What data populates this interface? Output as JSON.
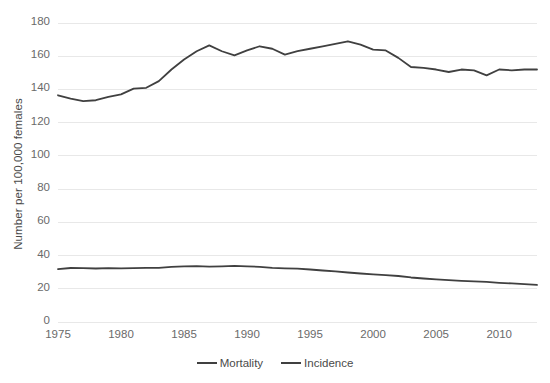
{
  "chart_data": {
    "type": "line",
    "title": "",
    "xlabel": "",
    "ylabel": "Number per 100,000 females",
    "xlim": [
      1975,
      2013
    ],
    "ylim": [
      0,
      180
    ],
    "ytick_labels": [
      "180",
      "160",
      "140",
      "120",
      "100",
      "80",
      "60",
      "40",
      "20",
      "0"
    ],
    "ytick_values": [
      180,
      160,
      140,
      120,
      100,
      80,
      60,
      40,
      20,
      0
    ],
    "xtick_labels": [
      "1975",
      "1980",
      "1985",
      "1990",
      "1995",
      "2000",
      "2005",
      "2010"
    ],
    "xtick_values": [
      1975,
      1980,
      1985,
      1990,
      1995,
      2000,
      2005,
      2010
    ],
    "grid": true,
    "grid_axis": "y",
    "legend_position": "bottom",
    "x": [
      1975,
      1976,
      1977,
      1978,
      1979,
      1980,
      1981,
      1982,
      1983,
      1984,
      1985,
      1986,
      1987,
      1988,
      1989,
      1990,
      1991,
      1992,
      1993,
      1994,
      1995,
      1996,
      1997,
      1998,
      1999,
      2000,
      2001,
      2002,
      2003,
      2004,
      2005,
      2006,
      2007,
      2008,
      2009,
      2010,
      2011,
      2012,
      2013
    ],
    "series": [
      {
        "name": "Incidence",
        "color": "#404040",
        "values": [
          136.5,
          134.5,
          133.0,
          133.5,
          135.5,
          137.0,
          140.5,
          141.0,
          145.0,
          152.0,
          158.0,
          163.0,
          166.5,
          163.0,
          160.5,
          163.5,
          166.0,
          164.5,
          161.0,
          163.0,
          164.5,
          166.0,
          167.5,
          169.0,
          167.0,
          164.0,
          163.5,
          159.0,
          153.5,
          153.0,
          152.0,
          150.5,
          152.0,
          151.5,
          148.5,
          152.0,
          151.5,
          152.0,
          152.0
        ]
      },
      {
        "name": "Mortality",
        "color": "#404040",
        "values": [
          31.8,
          32.5,
          32.4,
          32.2,
          32.4,
          32.3,
          32.4,
          32.6,
          32.6,
          33.2,
          33.5,
          33.6,
          33.3,
          33.5,
          33.8,
          33.5,
          33.2,
          32.6,
          32.3,
          32.1,
          31.6,
          31.0,
          30.5,
          29.8,
          29.2,
          28.7,
          28.2,
          27.7,
          26.8,
          26.2,
          25.7,
          25.2,
          24.8,
          24.5,
          24.1,
          23.6,
          23.2,
          22.8,
          22.3
        ]
      }
    ]
  },
  "legend": {
    "entries": [
      {
        "label": "Mortality"
      },
      {
        "label": "Incidence"
      }
    ]
  },
  "style": {
    "background": "#ffffff",
    "line_color": "#404040",
    "grid_color": "#e8e8e8",
    "text_color": "#6a6a6a"
  }
}
